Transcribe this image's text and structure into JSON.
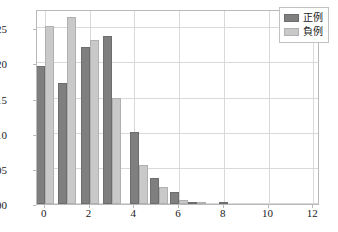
{
  "chart_data": {
    "type": "bar",
    "title": "",
    "xlabel": "",
    "ylabel": "",
    "xlim": [
      -0.35,
      12.3
    ],
    "ylim": [
      0.0,
      0.2775
    ],
    "grid": true,
    "legend_position": "top-right",
    "bin_width": 0.8,
    "x": [
      0.0,
      1.0,
      2.0,
      3.0,
      4.2,
      5.1,
      6.0,
      6.8,
      8.2
    ],
    "xticks": [
      0,
      2,
      4,
      6,
      8,
      10,
      12
    ],
    "xtick_labels": [
      "0",
      "2",
      "4",
      "6",
      "8",
      "10",
      "12"
    ],
    "yticks": [
      0.0,
      0.05,
      0.1,
      0.15,
      0.2,
      0.25
    ],
    "ytick_labels": [
      "0.00",
      "0.05",
      "0.10",
      "0.15",
      "0.20",
      "0.25"
    ],
    "series": [
      {
        "name": "正例",
        "color": "#7f7f7f",
        "values": [
          0.196,
          0.172,
          0.224,
          0.239,
          0.102,
          0.037,
          0.017,
          0.003,
          0.001
        ]
      },
      {
        "name": "負例",
        "color": "#c9c9c9",
        "values": [
          0.254,
          0.266,
          0.233,
          0.151,
          0.055,
          0.024,
          0.006,
          0.002,
          0.0
        ]
      }
    ]
  },
  "legend": {
    "entries": [
      {
        "label": "正例",
        "swatch": "dark-gray-swatch"
      },
      {
        "label": "負例",
        "swatch": "light-gray-swatch"
      }
    ]
  }
}
